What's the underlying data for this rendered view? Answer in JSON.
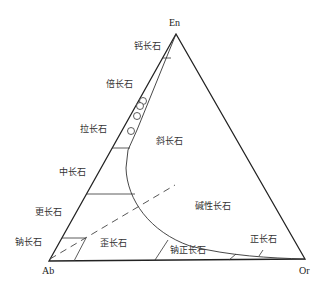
{
  "diagram": {
    "corners": {
      "top": "En",
      "left": "Ab",
      "right": "Or"
    },
    "fields": {
      "anorthite": "钙长石",
      "bytownite": "倍长石",
      "labradorite": "拉长石",
      "andesine": "中长石",
      "oligoclase": "更长石",
      "albite": "钠长石",
      "plagioclase": "斜长石",
      "alkali_feldspar": "碱性长石",
      "anorthoclase": "歪长石",
      "sodic_orthoclase": "钠正长石",
      "orthoclase": "正长石"
    },
    "colors": {
      "line": "#222222",
      "text": "#333333"
    }
  }
}
